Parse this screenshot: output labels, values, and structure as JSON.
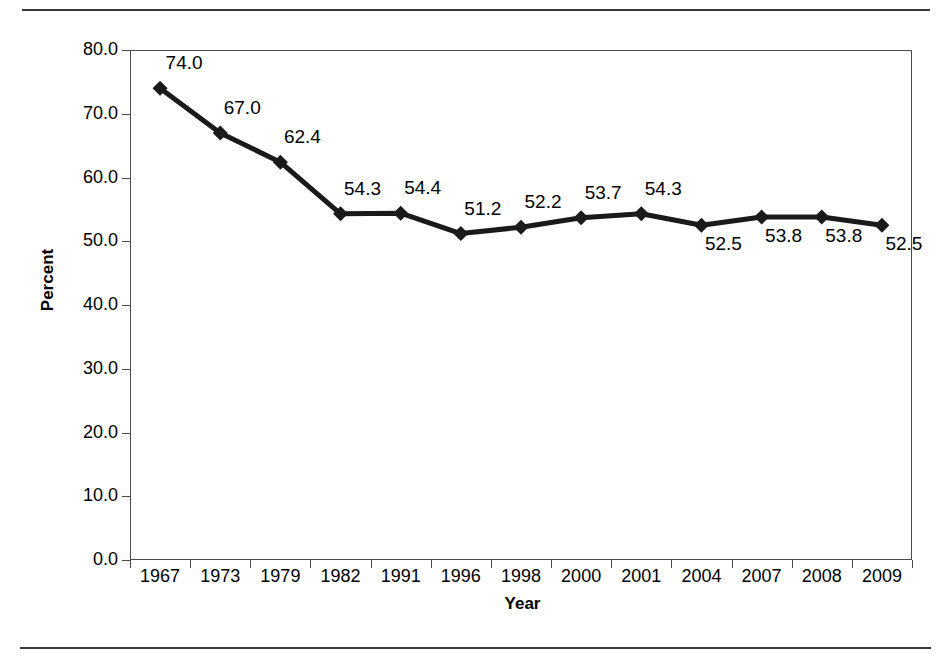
{
  "chart_data": {
    "type": "line",
    "title": "",
    "xlabel": "Year",
    "ylabel": "Percent",
    "categories": [
      "1967",
      "1973",
      "1979",
      "1982",
      "1991",
      "1996",
      "1998",
      "2000",
      "2001",
      "2004",
      "2007",
      "2008",
      "2009"
    ],
    "values": [
      74.0,
      67.0,
      62.4,
      54.3,
      54.4,
      51.2,
      52.2,
      53.7,
      54.3,
      52.5,
      53.8,
      53.8,
      52.5
    ],
    "point_labels": [
      "74.0",
      "67.0",
      "62.4",
      "54.3",
      "54.4",
      "51.2",
      "52.2",
      "53.7",
      "54.3",
      "52.5",
      "53.8",
      "53.8",
      "52.5"
    ],
    "label_placement": [
      "above",
      "above",
      "above",
      "above",
      "above",
      "above",
      "above",
      "above",
      "above",
      "below",
      "below",
      "below",
      "below"
    ],
    "ylim": [
      0.0,
      80.0
    ],
    "ytick_labels": [
      "0.0",
      "10.0",
      "20.0",
      "30.0",
      "40.0",
      "50.0",
      "60.0",
      "70.0",
      "80.0"
    ],
    "ytick_values": [
      0,
      10,
      20,
      30,
      40,
      50,
      60,
      70,
      80
    ],
    "grid": false,
    "legend": "none",
    "marker": "diamond",
    "line_color": "#1a1a1a",
    "marker_color": "#1a1a1a",
    "frame_color": "#4a4a4a",
    "background": "#ffffff"
  },
  "page": {
    "top_rule": "",
    "bottom_rule": ""
  }
}
